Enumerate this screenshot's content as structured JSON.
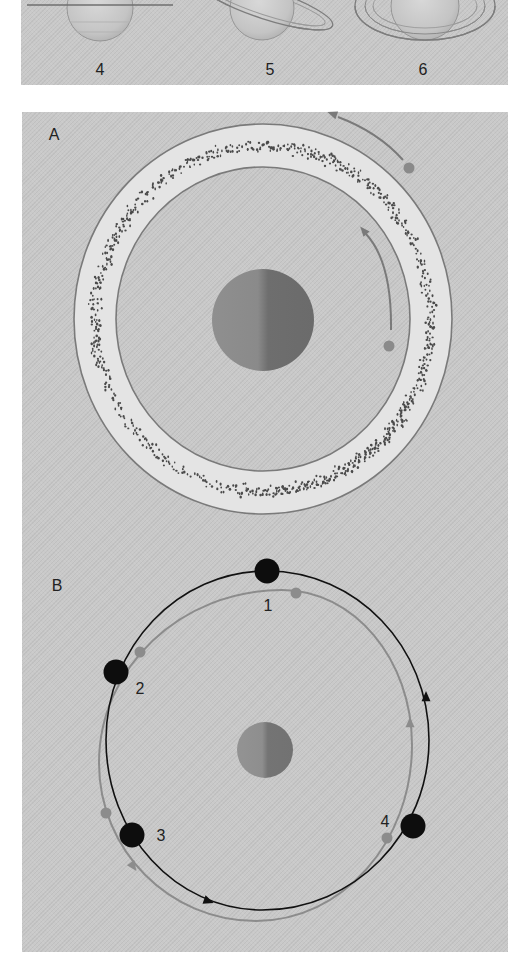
{
  "figure": {
    "top_strip": {
      "background": "#c9c9c9",
      "planets": [
        {
          "label": "4",
          "label_x": 100,
          "label_y": 70,
          "cx": 100,
          "cy": 8,
          "r": 33,
          "rings": [
            {
              "type": "line",
              "x1": 27,
              "y1": 5,
              "x2": 173,
              "y2": 5,
              "stroke": "#6f6f6f",
              "width": 1.4
            }
          ],
          "bands": [
            14,
            24
          ]
        },
        {
          "label": "5",
          "label_x": 270,
          "label_y": 70,
          "cx": 262,
          "cy": 8,
          "r": 32,
          "rings": [
            {
              "type": "ellipse",
              "cx": 266,
              "cy": 4,
              "rx": 70,
              "ry": 15,
              "rotate": 18,
              "stroke": "#7d7d7d",
              "width": 1.3
            },
            {
              "type": "ellipse",
              "cx": 266,
              "cy": 4,
              "rx": 62,
              "ry": 11,
              "rotate": 18,
              "stroke": "#9a9a9a",
              "width": 1.0
            }
          ],
          "bands": []
        },
        {
          "label": "6",
          "label_x": 423,
          "label_y": 70,
          "cx": 425,
          "cy": 6,
          "r": 34,
          "rings": [
            {
              "type": "ellipse",
              "cx": 425,
              "cy": 6,
              "rx": 70,
              "ry": 34,
              "rotate": 0,
              "stroke": "#7d7d7d",
              "width": 1.3
            },
            {
              "type": "ellipse",
              "cx": 425,
              "cy": 6,
              "rx": 60,
              "ry": 28,
              "rotate": 0,
              "stroke": "#8a8a8a",
              "width": 1.0
            },
            {
              "type": "ellipse",
              "cx": 425,
              "cy": 6,
              "rx": 52,
              "ry": 22,
              "rotate": 0,
              "stroke": "#9a9a9a",
              "width": 0.9
            }
          ],
          "bands": []
        }
      ]
    },
    "panel_a": {
      "label": "A",
      "label_x": 54,
      "label_y": 135,
      "ring_band": {
        "cx": 263,
        "cy": 319,
        "outer_rx": 189,
        "outer_ry": 195,
        "inner_rx": 147,
        "inner_ry": 152,
        "fill": "#e4e4e4",
        "stroke": "#7a7a7a"
      },
      "particles": {
        "cx": 263,
        "cy": 319,
        "rx_mid": 168,
        "ry_mid": 173,
        "spread": 6,
        "count": 900,
        "color": "#4a4a4a",
        "seed": 7
      },
      "planet": {
        "cx": 263,
        "cy": 320,
        "r": 51,
        "light": "#8f8f8f",
        "dark": "#6b6b6b"
      },
      "moons": [
        {
          "name": "inner-moon",
          "cx": 389,
          "cy": 346,
          "r": 5.5,
          "color": "#8a8a8a"
        },
        {
          "name": "outer-moon",
          "cx": 409,
          "cy": 168,
          "r": 5.5,
          "color": "#8a8a8a"
        }
      ],
      "arrows": [
        {
          "name": "inner-orbit-arrow",
          "d": "M 391 330 Q 392 262 366 234",
          "head_x": 364,
          "head_y": 231,
          "head_angle": -130,
          "color": "#7a7a7a"
        },
        {
          "name": "outer-orbit-arrow",
          "d": "M 403 160 Q 378 132 338 117",
          "head_x": 333,
          "head_y": 114,
          "head_angle": -160,
          "color": "#7a7a7a"
        }
      ]
    },
    "panel_b": {
      "label": "B",
      "label_x": 57,
      "label_y": 586,
      "planet": {
        "cx": 265,
        "cy": 750,
        "r": 28,
        "light": "#939393",
        "dark": "#727272"
      },
      "orbits": [
        {
          "name": "black-orbit",
          "color": "#111111",
          "width": 1.6,
          "top": [
            267,
            571
          ],
          "right": [
            429,
            740
          ],
          "bottom": [
            262,
            910
          ],
          "left": [
            106,
            740
          ]
        },
        {
          "name": "gray-orbit",
          "color": "#8c8c8c",
          "width": 2.0,
          "top": [
            282,
            590
          ],
          "right": [
            412,
            745
          ],
          "bottom": [
            256,
            921
          ],
          "left": [
            99,
            763
          ]
        }
      ],
      "arrowheads": [
        {
          "name": "black-arrow-right",
          "x": 426,
          "y": 697,
          "angle": -90,
          "color": "#111111",
          "size": 6
        },
        {
          "name": "black-arrow-bottom",
          "x": 208,
          "y": 901,
          "angle": 20,
          "color": "#111111",
          "size": 6
        },
        {
          "name": "gray-arrow-right",
          "x": 410,
          "y": 723,
          "angle": -90,
          "color": "#8c8c8c",
          "size": 6
        },
        {
          "name": "gray-arrow-left",
          "x": 133,
          "y": 866,
          "angle": 55,
          "color": "#8c8c8c",
          "size": 6
        }
      ],
      "positions": [
        {
          "label": "1",
          "label_x": 268,
          "label_y": 606,
          "black": [
            267,
            571
          ],
          "gray": [
            296,
            593
          ]
        },
        {
          "label": "2",
          "label_x": 140,
          "label_y": 689,
          "black": [
            116,
            672
          ],
          "gray": [
            140,
            652
          ]
        },
        {
          "label": "3",
          "label_x": 161,
          "label_y": 836,
          "black": [
            132,
            835
          ],
          "gray": [
            106,
            813
          ]
        },
        {
          "label": "4",
          "label_x": 385,
          "label_y": 822,
          "black": [
            413,
            826
          ],
          "gray": [
            387,
            838
          ]
        }
      ],
      "black_dot_r": 12.5,
      "gray_dot_r": 5.5,
      "gray_dot_color": "#8c8c8c"
    }
  }
}
